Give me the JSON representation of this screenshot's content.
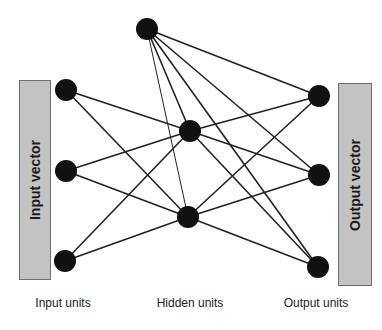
{
  "diagram": {
    "type": "neural-network",
    "input_box": {
      "label": "Input vector",
      "x": 19,
      "y": 80,
      "w": 32,
      "h": 200
    },
    "output_box": {
      "label": "Output vector",
      "x": 338,
      "y": 83,
      "w": 34,
      "h": 203
    },
    "column_labels": [
      {
        "id": "input",
        "text": "Input units",
        "x": 63
      },
      {
        "id": "hidden",
        "text": "Hidden units",
        "x": 190
      },
      {
        "id": "output",
        "text": "Output units",
        "x": 316
      }
    ],
    "node_radius": 11,
    "node_color": "#111111",
    "edge_color": "#222222",
    "nodes": [
      {
        "id": "I1",
        "layer": "input",
        "x": 66,
        "y": 90
      },
      {
        "id": "I2",
        "layer": "input",
        "x": 66,
        "y": 171
      },
      {
        "id": "I3",
        "layer": "input",
        "x": 65,
        "y": 261
      },
      {
        "id": "H0",
        "layer": "hidden",
        "x": 147,
        "y": 29
      },
      {
        "id": "H1",
        "layer": "hidden",
        "x": 190,
        "y": 131
      },
      {
        "id": "H2",
        "layer": "hidden",
        "x": 188,
        "y": 217
      },
      {
        "id": "O1",
        "layer": "output",
        "x": 319,
        "y": 96
      },
      {
        "id": "O2",
        "layer": "output",
        "x": 319,
        "y": 175
      },
      {
        "id": "O3",
        "layer": "output",
        "x": 318,
        "y": 267
      }
    ],
    "edges": [
      [
        "I1",
        "H1"
      ],
      [
        "I1",
        "H2"
      ],
      [
        "I2",
        "H1"
      ],
      [
        "I2",
        "H2"
      ],
      [
        "I3",
        "H1"
      ],
      [
        "I3",
        "H2"
      ],
      [
        "H0",
        "H1"
      ],
      [
        "H0",
        "H2"
      ],
      [
        "H0",
        "O1"
      ],
      [
        "H0",
        "O2"
      ],
      [
        "H0",
        "O3"
      ],
      [
        "H1",
        "O1"
      ],
      [
        "H1",
        "O2"
      ],
      [
        "H1",
        "O3"
      ],
      [
        "H2",
        "O1"
      ],
      [
        "H2",
        "O2"
      ],
      [
        "H2",
        "O3"
      ]
    ]
  }
}
